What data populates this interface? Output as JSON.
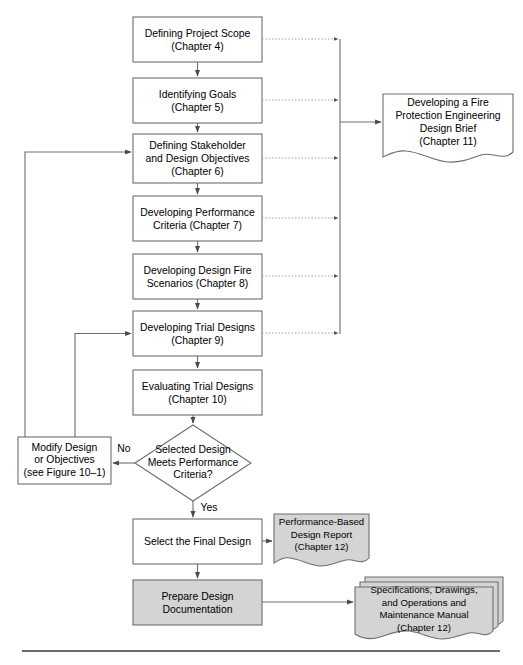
{
  "figure": {
    "colors": {
      "line": "#6e6e6e",
      "text": "#000000",
      "box_fill": "#ffffff",
      "shaded_fill": "#d4d4d4",
      "dotted": "#9a9a9a",
      "rule": "#3a3a3a"
    }
  },
  "nodes": {
    "defining_project_scope": {
      "label": "Defining Project Scope\n(Chapter 4)",
      "shape": "process",
      "shaded": false
    },
    "identifying_goals": {
      "label": "Identifying Goals\n(Chapter 5)",
      "shape": "process",
      "shaded": false
    },
    "defining_stakeholder": {
      "label": "Defining Stakeholder\nand Design Objectives\n(Chapter 6)",
      "shape": "process",
      "shaded": false
    },
    "developing_performance_criteria": {
      "label": "Developing Performance\nCriteria (Chapter 7)",
      "shape": "process",
      "shaded": false
    },
    "developing_design_fire_scenarios": {
      "label": "Developing Design Fire\nScenarios (Chapter 8)",
      "shape": "process",
      "shaded": false
    },
    "developing_trial_designs": {
      "label": "Developing Trial Designs\n(Chapter 9)",
      "shape": "process",
      "shaded": false
    },
    "evaluating_trial_designs": {
      "label": "Evaluating Trial Designs\n(Chapter 10)",
      "shape": "process",
      "shaded": false
    },
    "decision_criteria": {
      "label": "Selected Design\nMeets Performance\nCriteria?",
      "shape": "decision",
      "shaded": false
    },
    "modify_design": {
      "label": "Modify Design\nor Objectives\n(see Figure 10–1)",
      "shape": "process",
      "shaded": false
    },
    "select_final_design": {
      "label": "Select the Final Design",
      "shape": "process",
      "shaded": false
    },
    "prepare_design_documentation": {
      "label": "Prepare Design\nDocumentation",
      "shape": "process",
      "shaded": true
    },
    "design_brief": {
      "label": "Developing a Fire\nProtection Engineering\nDesign Brief\n(Chapter 11)",
      "shape": "document",
      "shaded": false
    },
    "performance_based_design_report": {
      "label": "Performance-Based\nDesign Report\n(Chapter 12)",
      "shape": "document",
      "shaded": true
    },
    "specifications_drawings": {
      "label": "Specifications, Drawings,\nand Operations and\nMaintenance Manual\n(Chapter 12)",
      "shape": "multi-document",
      "shaded": true
    }
  },
  "edge_labels": {
    "no": "No",
    "yes": "Yes"
  }
}
